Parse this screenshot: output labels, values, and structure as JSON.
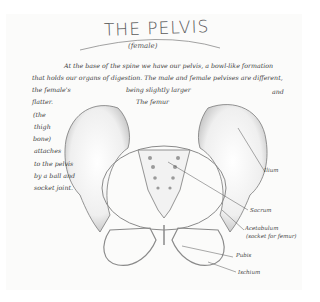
{
  "sheet": {
    "title": "THE PELVIS",
    "subtitle": "(female)",
    "body_lines": [
      "At the base of the spine we have our pelvis, a bowl-like formation",
      "that holds our organs of digestion. The male and female pelvises are different,",
      "the female's",
      "being slightly larger",
      "and",
      "flatter.",
      "The femur",
      "(the",
      "thigh",
      "bone)",
      "attaches",
      "to the pelvis",
      "by a ball and",
      "socket joint."
    ],
    "labels": {
      "ilium": "Ilium",
      "sacrum": "Sacrum",
      "acetabulum": "Acetabulum",
      "acetabulum_note": "(socket for femur)",
      "pubis": "Pubis",
      "ischium": "Ischium"
    },
    "colors": {
      "paper": "#fbfbfa",
      "pencil": "#3d3d3d",
      "shading": "#9a9a9a"
    }
  }
}
